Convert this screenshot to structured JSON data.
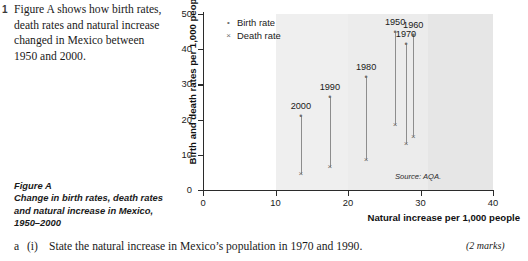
{
  "question": {
    "number": "1",
    "text": "Figure A shows how birth rates, death rates and natural increase changed in Mexico between 1950 and 2000."
  },
  "figure_caption": {
    "title": "Figure A",
    "subtitle": "Change in birth rates, death rates and natural increase in Mexico, 1950–2000"
  },
  "answer_row": {
    "part": "a",
    "roman": "(i)",
    "text": "State the natural increase in Mexico’s population in 1970 and 1990.",
    "marks": "(2 marks)"
  },
  "chart_data": {
    "type": "scatter",
    "title": "",
    "xlabel": "Natural increase per 1,000 people",
    "ylabel": "Birth and death rates per 1,000 people",
    "xlim": [
      0,
      40
    ],
    "ylim": [
      0,
      50
    ],
    "xticks": [
      0,
      10,
      20,
      30,
      40
    ],
    "yticks": [
      0,
      10,
      20,
      30,
      40,
      50
    ],
    "grid": false,
    "legend_position": "top-left",
    "legend": [
      {
        "label": "Birth rate",
        "marker": "dot"
      },
      {
        "label": "Death rate",
        "marker": "cross"
      }
    ],
    "shaded_bands": [
      {
        "x0": 10,
        "x1": 20,
        "color": "#efefef"
      },
      {
        "x0": 20,
        "x1": 31,
        "color": "#ececec"
      },
      {
        "x0": 31,
        "x1": 40,
        "color": "#e6e6e6"
      }
    ],
    "source": "Source: AQA.",
    "points": [
      {
        "year": "1950",
        "natural_increase": 26.5,
        "birth_rate": 45.0,
        "death_rate": 18.5,
        "label_pos": "above"
      },
      {
        "year": "1960",
        "natural_increase": 29.0,
        "birth_rate": 44.0,
        "death_rate": 15.0,
        "label_pos": "above"
      },
      {
        "year": "1970",
        "natural_increase": 28.0,
        "birth_rate": 41.5,
        "death_rate": 13.0,
        "label_pos": "above"
      },
      {
        "year": "1980",
        "natural_increase": 22.5,
        "birth_rate": 32.0,
        "death_rate": 8.5,
        "label_pos": "above"
      },
      {
        "year": "1990",
        "natural_increase": 17.5,
        "birth_rate": 26.5,
        "death_rate": 6.5,
        "label_pos": "above"
      },
      {
        "year": "2000",
        "natural_increase": 13.5,
        "birth_rate": 21.0,
        "death_rate": 4.5,
        "label_pos": "above"
      }
    ],
    "markers": {
      "dot": "•",
      "cross": "×"
    }
  }
}
